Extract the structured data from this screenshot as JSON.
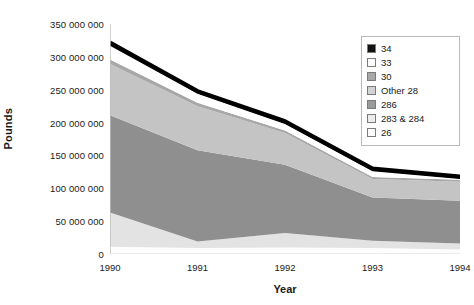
{
  "chart_data": {
    "type": "area",
    "stacked": true,
    "title": "",
    "xlabel": "Year",
    "ylabel": "Pounds",
    "categories": [
      1990,
      1991,
      1992,
      1993,
      1994
    ],
    "x_tick_labels": [
      "1990",
      "1991",
      "1992",
      "1993",
      "1994"
    ],
    "y_tick_labels": [
      "0",
      "50 000 000",
      "100 000 000",
      "150 000 000",
      "200 000 000",
      "250 000 000",
      "300 000 000",
      "350 000 000"
    ],
    "y_tick_values": [
      0,
      50000000,
      100000000,
      150000000,
      200000000,
      250000000,
      300000000,
      350000000
    ],
    "ylim": [
      0,
      350000000
    ],
    "grid": false,
    "legend_position": "top-right",
    "totals": [
      322000000,
      248000000,
      202000000,
      130000000,
      118000000
    ],
    "series": [
      {
        "name": "26",
        "color": "#fdfdfd",
        "values": [
          11000000,
          9000000,
          10000000,
          9000000,
          7000000
        ]
      },
      {
        "name": "283 & 284",
        "color": "#e3e3e3",
        "values": [
          52000000,
          10000000,
          22000000,
          11000000,
          9000000
        ]
      },
      {
        "name": "286",
        "color": "#8f8f8f",
        "values": [
          148000000,
          139000000,
          104000000,
          66000000,
          65000000
        ]
      },
      {
        "name": "Other 28",
        "color": "#c4c4c4",
        "values": [
          78000000,
          67000000,
          48000000,
          28000000,
          29000000
        ]
      },
      {
        "name": "30",
        "color": "#a8a8a8",
        "values": [
          7000000,
          5000000,
          4000000,
          3000000,
          3000000
        ]
      },
      {
        "name": "33",
        "color": "#ffffff",
        "values": [
          21000000,
          14000000,
          10000000,
          9000000,
          1000000
        ]
      },
      {
        "name": "34",
        "color": "#000000",
        "values": [
          5000000,
          4000000,
          4000000,
          4000000,
          4000000
        ]
      }
    ],
    "legend_entries": [
      {
        "label": "34",
        "color": "#111111"
      },
      {
        "label": "33",
        "color": "#ffffff"
      },
      {
        "label": "30",
        "color": "#a8a8a8"
      },
      {
        "label": "Other 28",
        "color": "#d2d2d2"
      },
      {
        "label": "286",
        "color": "#9a9a9a"
      },
      {
        "label": "283 & 284",
        "color": "#ececec"
      },
      {
        "label": "26",
        "color": "#fdfdfd"
      }
    ]
  }
}
